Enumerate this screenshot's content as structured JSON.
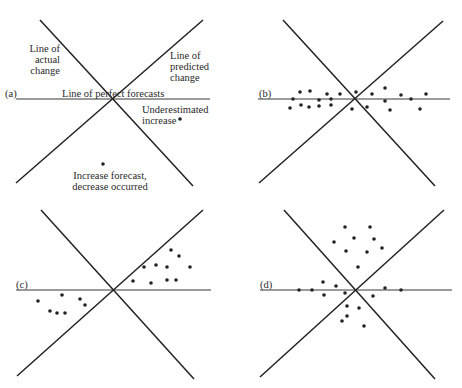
{
  "colors": {
    "ink": "#222222",
    "background": "#ffffff"
  },
  "panels": [
    {
      "id": "a",
      "tag": "(a)",
      "labels": {
        "actual": [
          "Line of",
          "actual",
          "change"
        ],
        "predicted": [
          "Line of",
          "predicted",
          "change"
        ],
        "perfect": "Line of perfect forecasts",
        "under": [
          "Underestimated",
          "increase"
        ],
        "wrongdir": [
          "Increase forecast,",
          "decrease occurred"
        ]
      },
      "hline": [
        16,
        99,
        210,
        99
      ],
      "diag1": [
        40,
        20,
        193,
        186
      ],
      "diag2": [
        16,
        183,
        203,
        20
      ],
      "dots": [
        [
          180,
          119
        ],
        [
          103,
          164
        ]
      ]
    },
    {
      "id": "b",
      "tag": "(b)",
      "hline": [
        258,
        99,
        450,
        99
      ],
      "diag1": [
        283,
        20,
        435,
        186
      ],
      "diag2": [
        259,
        183,
        443,
        21
      ],
      "dots": [
        [
          293,
          99
        ],
        [
          300,
          92
        ],
        [
          310,
          91
        ],
        [
          319,
          100
        ],
        [
          331,
          99
        ],
        [
          327,
          94
        ],
        [
          340,
          94
        ],
        [
          356,
          92
        ],
        [
          372,
          94
        ],
        [
          385,
          88
        ],
        [
          401,
          95
        ],
        [
          411,
          99
        ],
        [
          426,
          94
        ],
        [
          385,
          101
        ],
        [
          290,
          108
        ],
        [
          301,
          105
        ],
        [
          309,
          107
        ],
        [
          319,
          106
        ],
        [
          331,
          105
        ],
        [
          352,
          109
        ],
        [
          367,
          107
        ],
        [
          390,
          110
        ],
        [
          420,
          109
        ]
      ]
    },
    {
      "id": "c",
      "tag": "(c)",
      "hline": [
        16,
        290,
        211,
        290
      ],
      "diag1": [
        41,
        210,
        194,
        379
      ],
      "diag2": [
        17,
        376,
        203,
        210
      ],
      "dots": [
        [
          171,
          250
        ],
        [
          179,
          256
        ],
        [
          144,
          267
        ],
        [
          156,
          265
        ],
        [
          167,
          267
        ],
        [
          190,
          267
        ],
        [
          133,
          281
        ],
        [
          151,
          283
        ],
        [
          167,
          280
        ],
        [
          176,
          280
        ],
        [
          38,
          301
        ],
        [
          62,
          295
        ],
        [
          80,
          299
        ],
        [
          85,
          305
        ],
        [
          50,
          311
        ],
        [
          57,
          313
        ],
        [
          65,
          313
        ]
      ]
    },
    {
      "id": "d",
      "tag": "(d)",
      "hline": [
        260,
        290,
        452,
        290
      ],
      "diag1": [
        284,
        210,
        435,
        379
      ],
      "diag2": [
        260,
        377,
        444,
        210
      ],
      "dots": [
        [
          345,
          227
        ],
        [
          370,
          227
        ],
        [
          334,
          242
        ],
        [
          354,
          238
        ],
        [
          374,
          239
        ],
        [
          346,
          251
        ],
        [
          367,
          252
        ],
        [
          382,
          248
        ],
        [
          358,
          267
        ],
        [
          323,
          282
        ],
        [
          336,
          286
        ],
        [
          299,
          290
        ],
        [
          312,
          290
        ],
        [
          324,
          295
        ],
        [
          345,
          293
        ],
        [
          385,
          288
        ],
        [
          401,
          290
        ],
        [
          373,
          296
        ],
        [
          347,
          306
        ],
        [
          359,
          308
        ],
        [
          347,
          316
        ],
        [
          342,
          321
        ],
        [
          364,
          326
        ]
      ]
    }
  ]
}
